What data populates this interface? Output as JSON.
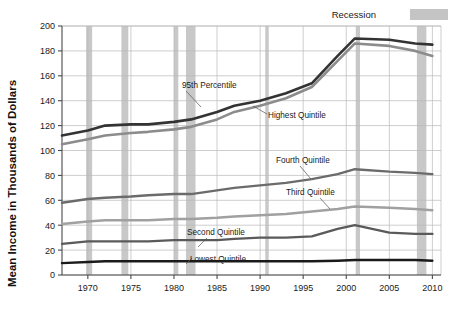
{
  "legend": {
    "recession_label": "Recession",
    "recession_swatch_color": "#c4c4c4"
  },
  "axes": {
    "ylabel": "Mean Income in Thousands of Dollars",
    "xlabel": "",
    "y_ticks": [
      "0",
      "20",
      "40",
      "60",
      "80",
      "100",
      "120",
      "140",
      "160",
      "180",
      "200"
    ],
    "x_ticks": [
      "1970",
      "1975",
      "1980",
      "1985",
      "1990",
      "1995",
      "2000",
      "2005",
      "2010"
    ]
  },
  "annotations": {
    "p95": "95th Percentile",
    "highest": "Highest  Quintile",
    "fourth": "Fourth Quintile",
    "third": "Third Quintile",
    "second": "Second Quintile",
    "lowest": "Lowest Quintile"
  },
  "chart_data": {
    "type": "line",
    "title": "",
    "xlabel": "",
    "ylabel": "Mean Income in Thousands of Dollars",
    "xlim": [
      1967,
      2011
    ],
    "ylim": [
      0,
      200
    ],
    "grid": true,
    "legend_position": "top-right",
    "x": [
      1967,
      1970,
      1972,
      1975,
      1977,
      1980,
      1982,
      1985,
      1987,
      1990,
      1993,
      1996,
      1999,
      2001,
      2005,
      2008,
      2010
    ],
    "series": [
      {
        "name": "95th Percentile",
        "color": "#333333",
        "width": 2.6,
        "values": [
          112,
          116,
          120,
          121,
          121,
          123,
          125,
          131,
          136,
          140,
          146,
          154,
          176,
          190,
          189,
          186,
          185
        ]
      },
      {
        "name": "Highest  Quintile",
        "color": "#8c8c8c",
        "width": 2.6,
        "values": [
          105,
          109,
          112,
          114,
          115,
          117,
          119,
          125,
          131,
          136,
          142,
          151,
          172,
          186,
          184,
          180,
          176
        ]
      },
      {
        "name": "Fourth Quintile",
        "color": "#6b6b6b",
        "width": 2.4,
        "values": [
          58,
          61,
          62,
          63,
          64,
          65,
          65,
          68,
          70,
          72,
          74,
          77,
          81,
          85,
          83,
          82,
          81
        ]
      },
      {
        "name": "Third Quintile",
        "color": "#a0a0a0",
        "width": 2.4,
        "values": [
          41,
          43,
          44,
          44,
          44,
          45,
          45,
          46,
          47,
          48,
          49,
          51,
          53,
          55,
          54,
          53,
          52
        ]
      },
      {
        "name": "Second Quintile",
        "color": "#5a5a5a",
        "width": 2.4,
        "values": [
          25,
          27,
          27,
          27,
          27,
          28,
          28,
          28,
          29,
          30,
          30,
          31,
          37,
          40,
          34,
          33,
          33
        ]
      },
      {
        "name": "Lowest Quintile",
        "color": "#1a1a1a",
        "width": 2.4,
        "values": [
          9.5,
          10.5,
          11,
          11,
          11,
          11,
          11,
          11,
          11,
          11,
          11,
          11,
          11.5,
          12,
          12,
          12,
          11.5
        ]
      }
    ],
    "recession_bands": [
      {
        "start": 1969.8,
        "end": 1970.5
      },
      {
        "start": 1973.9,
        "end": 1974.7
      },
      {
        "start": 1980.0,
        "end": 1980.5
      },
      {
        "start": 1981.4,
        "end": 1982.5
      },
      {
        "start": 1990.6,
        "end": 1991.0
      },
      {
        "start": 2001.1,
        "end": 2001.6
      },
      {
        "start": 2008.2,
        "end": 2009.3
      }
    ],
    "recession_color": "#c8c8c8"
  }
}
